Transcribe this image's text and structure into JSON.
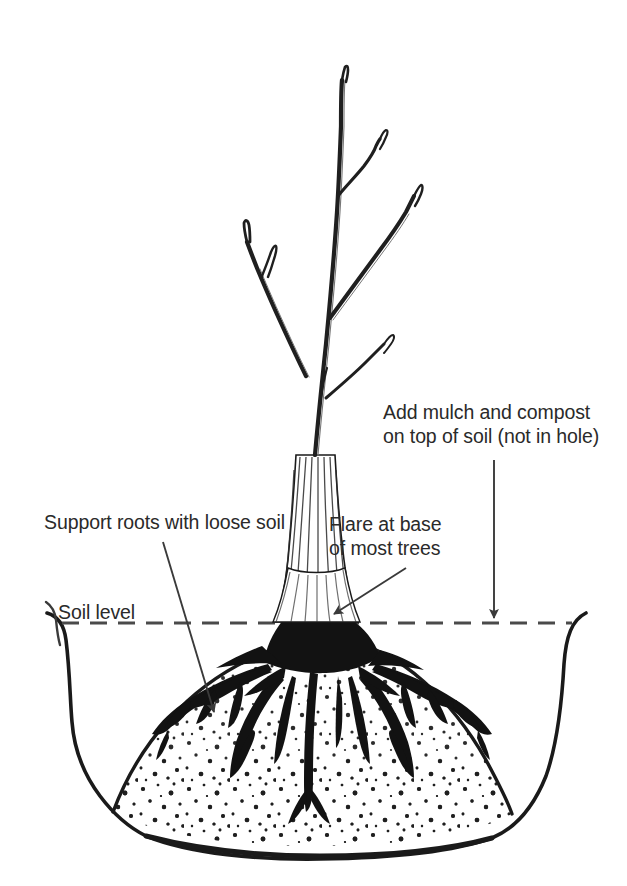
{
  "figure": {
    "background_color": "#ffffff",
    "ink_color": "#1a1a1a",
    "text_color": "#2a2a2a"
  },
  "labels": {
    "mulch_line1": "Add mulch and compost",
    "mulch_line2": "on top of soil (not in hole)",
    "support": "Support roots with loose soil",
    "flare_line1": "Flare at base",
    "flare_line2": "of most trees",
    "soil_level": "Soil level"
  },
  "annotations": [
    {
      "name": "mulch-callout",
      "text": "Add mulch and compost on top of soil (not in hole)",
      "leader": "vertical-arrow-down",
      "points_to": "soil-surface-right-of-trunk"
    },
    {
      "name": "support-callout",
      "text": "Support roots with loose soil",
      "leader": "diagonal-arrow-down-right",
      "points_to": "loose-soil-in-planting-hole"
    },
    {
      "name": "flare-callout",
      "text": "Flare at base of most trees",
      "leader": "diagonal-arrow-down-left",
      "points_to": "trunk-flare-at-soil-level"
    },
    {
      "name": "soil-level-callout",
      "text": "Soil level",
      "leader": "dashed-horizontal-line",
      "points_to": "grade-line"
    }
  ],
  "diagram_parts": [
    {
      "name": "tree-canopy-branches",
      "description": "bare branching sapling top"
    },
    {
      "name": "tree-trunk",
      "description": "striated trunk tapering down to flare"
    },
    {
      "name": "trunk-flare",
      "description": "widened base of trunk at soil level"
    },
    {
      "name": "root-mass",
      "description": "dense black spreading root system"
    },
    {
      "name": "soil-mound",
      "description": "stippled backfill cone beneath roots"
    },
    {
      "name": "planting-hole-outline",
      "description": "saucer-shaped excavated hole wall"
    },
    {
      "name": "soil-level-line",
      "description": "dashed grade line across figure"
    }
  ]
}
